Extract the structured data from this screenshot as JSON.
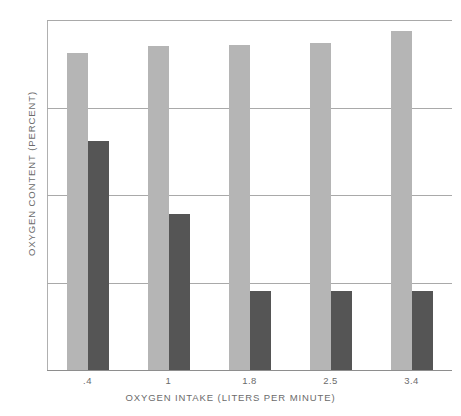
{
  "chart_data": {
    "type": "bar",
    "title": "",
    "xlabel": "OXYGEN INTAKE (LITERS PER MINUTE)",
    "ylabel": "OXYGEN CONTENT (PERCENT)",
    "categories": [
      ".4",
      "1",
      "1.8",
      "2.5",
      "3.4"
    ],
    "ylim": [
      0,
      20
    ],
    "yticks": [
      "0",
      "5",
      "10",
      "15",
      "20"
    ],
    "ytick_values": [
      0,
      5,
      10,
      15,
      20
    ],
    "grid": true,
    "legend_position": "none",
    "series": [
      {
        "name": "light",
        "color": "#b5b5b5",
        "values": [
          18.1,
          18.5,
          18.6,
          18.7,
          19.4
        ]
      },
      {
        "name": "dark",
        "color": "#555555",
        "values": [
          13.1,
          8.9,
          4.5,
          4.5,
          4.5
        ]
      }
    ]
  },
  "axes": {
    "y_title": "OXYGEN CONTENT (PERCENT)",
    "x_title": "OXYGEN INTAKE (LITERS PER MINUTE)"
  },
  "colors": {
    "light_bar": "#b5b5b5",
    "dark_bar": "#555555",
    "gridline": "#a9a9a9",
    "text": "#6b6b6b",
    "background": "#ffffff"
  }
}
